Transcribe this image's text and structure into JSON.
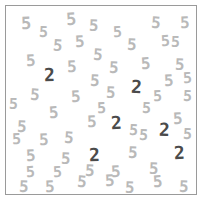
{
  "task": {
    "name": "visual-search-display",
    "description": "Visual search array of digit glyphs",
    "target_symbol": "2",
    "distractor_symbol": "5",
    "target_count": 6,
    "distractor_count": 55,
    "total_items": 61
  },
  "colors": {
    "background": "#ffffff",
    "frame_border": "#9a9a9a",
    "distractor_color": "#b9b9b9",
    "target_color": "#4b4b4b"
  },
  "frame": {
    "left": 5,
    "top": 5,
    "width": 192,
    "height": 190,
    "border_width": 1
  },
  "items": [
    {
      "char": "5",
      "role": "distractor",
      "x": 20,
      "y": 14,
      "size": 17,
      "rot": -2
    },
    {
      "char": "5",
      "role": "distractor",
      "x": 38,
      "y": 24,
      "size": 15,
      "rot": 3
    },
    {
      "char": "5",
      "role": "distractor",
      "x": 65,
      "y": 10,
      "size": 17,
      "rot": -4
    },
    {
      "char": "5",
      "role": "distractor",
      "x": 88,
      "y": 17,
      "size": 16,
      "rot": 2
    },
    {
      "char": "5",
      "role": "distractor",
      "x": 112,
      "y": 24,
      "size": 15,
      "rot": -3
    },
    {
      "char": "5",
      "role": "distractor",
      "x": 150,
      "y": 14,
      "size": 16,
      "rot": 4
    },
    {
      "char": "5",
      "role": "distractor",
      "x": 179,
      "y": 14,
      "size": 16,
      "rot": -2
    },
    {
      "char": "5",
      "role": "distractor",
      "x": 52,
      "y": 37,
      "size": 16,
      "rot": 5
    },
    {
      "char": "5",
      "role": "distractor",
      "x": 74,
      "y": 33,
      "size": 16,
      "rot": -3
    },
    {
      "char": "5",
      "role": "distractor",
      "x": 126,
      "y": 36,
      "size": 16,
      "rot": 3
    },
    {
      "char": "5",
      "role": "distractor",
      "x": 160,
      "y": 33,
      "size": 15,
      "rot": -4
    },
    {
      "char": "5",
      "role": "distractor",
      "x": 25,
      "y": 52,
      "size": 16,
      "rot": -3
    },
    {
      "char": "5",
      "role": "distractor",
      "x": 92,
      "y": 46,
      "size": 16,
      "rot": 4
    },
    {
      "char": "5",
      "role": "distractor",
      "x": 66,
      "y": 58,
      "size": 16,
      "rot": -2
    },
    {
      "char": "5",
      "role": "distractor",
      "x": 108,
      "y": 59,
      "size": 16,
      "rot": 3
    },
    {
      "char": "5",
      "role": "distractor",
      "x": 140,
      "y": 55,
      "size": 16,
      "rot": -4
    },
    {
      "char": "5",
      "role": "distractor",
      "x": 174,
      "y": 56,
      "size": 16,
      "rot": 2
    },
    {
      "char": "2",
      "role": "target",
      "x": 43,
      "y": 65,
      "size": 18,
      "rot": -2
    },
    {
      "char": "5",
      "role": "distractor",
      "x": 89,
      "y": 72,
      "size": 16,
      "rot": 3
    },
    {
      "char": "5",
      "role": "distractor",
      "x": 163,
      "y": 72,
      "size": 16,
      "rot": -3
    },
    {
      "char": "5",
      "role": "distractor",
      "x": 29,
      "y": 86,
      "size": 16,
      "rot": 4
    },
    {
      "char": "5",
      "role": "distractor",
      "x": 70,
      "y": 88,
      "size": 16,
      "rot": -3
    },
    {
      "char": "5",
      "role": "distractor",
      "x": 105,
      "y": 84,
      "size": 16,
      "rot": 2
    },
    {
      "char": "2",
      "role": "target",
      "x": 130,
      "y": 77,
      "size": 18,
      "rot": 3
    },
    {
      "char": "5",
      "role": "distractor",
      "x": 152,
      "y": 88,
      "size": 15,
      "rot": -2
    },
    {
      "char": "5",
      "role": "distractor",
      "x": 48,
      "y": 104,
      "size": 16,
      "rot": -4
    },
    {
      "char": "5",
      "role": "distractor",
      "x": 16,
      "y": 118,
      "size": 16,
      "rot": 3
    },
    {
      "char": "5",
      "role": "distractor",
      "x": 86,
      "y": 113,
      "size": 16,
      "rot": -2
    },
    {
      "char": "2",
      "role": "target",
      "x": 110,
      "y": 113,
      "size": 18,
      "rot": -3
    },
    {
      "char": "5",
      "role": "distractor",
      "x": 128,
      "y": 122,
      "size": 15,
      "rot": 4
    },
    {
      "char": "2",
      "role": "target",
      "x": 158,
      "y": 120,
      "size": 18,
      "rot": 2
    },
    {
      "char": "5",
      "role": "distractor",
      "x": 172,
      "y": 110,
      "size": 16,
      "rot": -3
    },
    {
      "char": "5",
      "role": "distractor",
      "x": 182,
      "y": 126,
      "size": 15,
      "rot": 3
    },
    {
      "char": "5",
      "role": "distractor",
      "x": 38,
      "y": 131,
      "size": 16,
      "rot": -2
    },
    {
      "char": "5",
      "role": "distractor",
      "x": 63,
      "y": 129,
      "size": 16,
      "rot": 4
    },
    {
      "char": "5",
      "role": "distractor",
      "x": 25,
      "y": 147,
      "size": 16,
      "rot": -3
    },
    {
      "char": "5",
      "role": "distractor",
      "x": 60,
      "y": 150,
      "size": 16,
      "rot": 2
    },
    {
      "char": "2",
      "role": "target",
      "x": 88,
      "y": 145,
      "size": 18,
      "rot": -2
    },
    {
      "char": "5",
      "role": "distractor",
      "x": 127,
      "y": 144,
      "size": 16,
      "rot": 3
    },
    {
      "char": "2",
      "role": "target",
      "x": 173,
      "y": 143,
      "size": 18,
      "rot": -3
    },
    {
      "char": "5",
      "role": "distractor",
      "x": 84,
      "y": 162,
      "size": 16,
      "rot": 3
    },
    {
      "char": "5",
      "role": "distractor",
      "x": 110,
      "y": 163,
      "size": 16,
      "rot": -3
    },
    {
      "char": "5",
      "role": "distractor",
      "x": 148,
      "y": 160,
      "size": 16,
      "rot": 2
    },
    {
      "char": "5",
      "role": "distractor",
      "x": 25,
      "y": 164,
      "size": 15,
      "rot": -4
    },
    {
      "char": "5",
      "role": "distractor",
      "x": 18,
      "y": 178,
      "size": 16,
      "rot": 3
    },
    {
      "char": "5",
      "role": "distractor",
      "x": 44,
      "y": 178,
      "size": 16,
      "rot": -2
    },
    {
      "char": "5",
      "role": "distractor",
      "x": 76,
      "y": 173,
      "size": 16,
      "rot": 4
    },
    {
      "char": "5",
      "role": "distractor",
      "x": 104,
      "y": 172,
      "size": 16,
      "rot": -3
    },
    {
      "char": "5",
      "role": "distractor",
      "x": 124,
      "y": 179,
      "size": 16,
      "rot": 2
    },
    {
      "char": "5",
      "role": "distractor",
      "x": 152,
      "y": 173,
      "size": 16,
      "rot": -4
    },
    {
      "char": "5",
      "role": "distractor",
      "x": 178,
      "y": 178,
      "size": 16,
      "rot": 3
    },
    {
      "char": "5",
      "role": "distractor",
      "x": 170,
      "y": 34,
      "size": 15,
      "rot": 2
    },
    {
      "char": "5",
      "role": "distractor",
      "x": 96,
      "y": 100,
      "size": 15,
      "rot": -2
    },
    {
      "char": "5",
      "role": "distractor",
      "x": 141,
      "y": 100,
      "size": 15,
      "rot": 3
    },
    {
      "char": "5",
      "role": "distractor",
      "x": 52,
      "y": 164,
      "size": 15,
      "rot": -3
    },
    {
      "char": "5",
      "role": "distractor",
      "x": 138,
      "y": 127,
      "size": 15,
      "rot": 4
    },
    {
      "char": "5",
      "role": "distractor",
      "x": 11,
      "y": 131,
      "size": 15,
      "rot": -2
    },
    {
      "char": "5",
      "role": "distractor",
      "x": 182,
      "y": 88,
      "size": 15,
      "rot": 3
    },
    {
      "char": "5",
      "role": "distractor",
      "x": 182,
      "y": 70,
      "size": 15,
      "rot": -3
    },
    {
      "char": "5",
      "role": "distractor",
      "x": 8,
      "y": 96,
      "size": 15,
      "rot": 2
    }
  ]
}
